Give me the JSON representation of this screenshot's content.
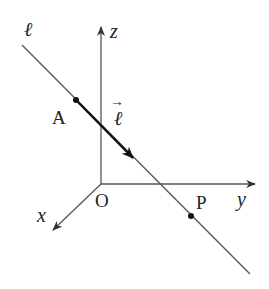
{
  "diagram": {
    "type": "3d-coordinate-line",
    "colors": {
      "axis": "#555555",
      "line": "#555555",
      "vector": "#111111",
      "point": "#111111",
      "text": "#222222"
    },
    "origin": {
      "label": "O",
      "x": 101,
      "y": 184
    },
    "axes": [
      {
        "name": "z",
        "label": "z",
        "from": [
          101,
          184
        ],
        "to": [
          101,
          26
        ]
      },
      {
        "name": "y",
        "label": "y",
        "from": [
          101,
          184
        ],
        "to": [
          256,
          184
        ]
      },
      {
        "name": "x",
        "label": "x",
        "from": [
          101,
          184
        ],
        "to": [
          52,
          231
        ]
      }
    ],
    "line": {
      "label": "ℓ",
      "from": [
        22,
        45
      ],
      "to": [
        250,
        274
      ]
    },
    "vector": {
      "label": "ℓ",
      "arrow_label": "→",
      "from": [
        76,
        100
      ],
      "to": [
        134,
        159
      ]
    },
    "points": [
      {
        "label": "A",
        "x": 76,
        "y": 100
      },
      {
        "label": "P",
        "x": 191,
        "y": 216
      }
    ]
  }
}
